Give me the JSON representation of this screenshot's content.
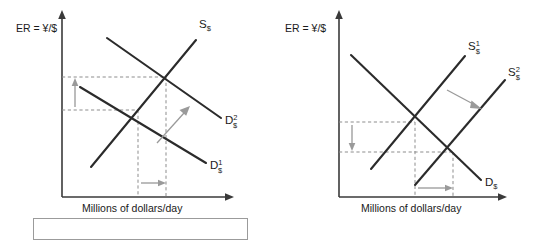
{
  "figure": {
    "panels": [
      {
        "id": "left",
        "name": "demand-shift-panel",
        "axes": {
          "y_label": "ER = ¥/$",
          "x_label": "Millions of dollars/day"
        },
        "curves": [
          {
            "name": "supply-curve",
            "base": "S",
            "superscript": "",
            "subscript": "$"
          },
          {
            "name": "demand-curve-1",
            "base": "D",
            "superscript": "1",
            "subscript": "$"
          },
          {
            "name": "demand-curve-2",
            "base": "D",
            "superscript": "2",
            "subscript": "$"
          }
        ],
        "annotations": {
          "vertical_arrow_direction": "up",
          "horizontal_arrow_direction": "right",
          "shift_arrow_direction": "up-right",
          "shift_description": "Demand for dollars increases"
        },
        "caption": ""
      },
      {
        "id": "right",
        "name": "supply-shift-panel",
        "axes": {
          "y_label": "ER = ¥/$",
          "x_label": "Millions of dollars/day"
        },
        "curves": [
          {
            "name": "supply-curve-1",
            "base": "S",
            "superscript": "1",
            "subscript": "$"
          },
          {
            "name": "supply-curve-2",
            "base": "S",
            "superscript": "2",
            "subscript": "$"
          },
          {
            "name": "demand-curve",
            "base": "D",
            "superscript": "",
            "subscript": "$"
          }
        ],
        "annotations": {
          "vertical_arrow_direction": "down",
          "horizontal_arrow_direction": "right",
          "shift_arrow_direction": "down-right",
          "shift_description": "Supply of dollars increases"
        },
        "caption": ""
      }
    ],
    "colors": {
      "curve": "#2b2b2b",
      "axis": "#3a3a3a",
      "dashed": "#8d8d8d",
      "arrow": "#9a9a9a",
      "background": "#ffffff",
      "box_border": "#9b9b9b"
    }
  }
}
